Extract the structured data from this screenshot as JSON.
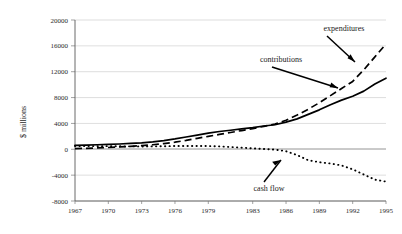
{
  "chart_data": {
    "type": "line",
    "title": "",
    "xlabel": "",
    "ylabel": "$ millions",
    "xlim": [
      1967,
      1995
    ],
    "ylim": [
      -8000,
      20000
    ],
    "grid": true,
    "legend_position": "inline-annotations",
    "x_tick_labels": [
      "1967",
      "1970",
      "1973",
      "1976",
      "1979",
      "1983",
      "1986",
      "1989",
      "1992",
      "1995"
    ],
    "x_tick_values": [
      1967,
      1970,
      1973,
      1976,
      1979,
      1983,
      1986,
      1989,
      1992,
      1995
    ],
    "y_tick_labels": [
      "20000",
      "16000",
      "12000",
      "8000",
      "4000",
      "0",
      "-4000",
      "-8000"
    ],
    "y_tick_values": [
      20000,
      16000,
      12000,
      8000,
      4000,
      0,
      -4000,
      -8000
    ],
    "x": [
      1967,
      1968,
      1969,
      1970,
      1971,
      1972,
      1973,
      1974,
      1975,
      1976,
      1977,
      1978,
      1979,
      1980,
      1981,
      1982,
      1983,
      1984,
      1985,
      1986,
      1987,
      1988,
      1989,
      1990,
      1991,
      1992,
      1993,
      1994,
      1995
    ],
    "series": [
      {
        "name": "contributions",
        "style": "solid",
        "color": "#000000",
        "values": [
          600,
          650,
          700,
          760,
          820,
          900,
          1000,
          1150,
          1350,
          1600,
          1900,
          2200,
          2500,
          2750,
          2950,
          3150,
          3350,
          3600,
          3800,
          4200,
          4700,
          5400,
          6100,
          6900,
          7600,
          8200,
          9000,
          10100,
          11000
        ]
      },
      {
        "name": "expenditures",
        "style": "dashed",
        "color": "#000000",
        "values": [
          100,
          150,
          210,
          280,
          360,
          450,
          560,
          700,
          880,
          1100,
          1380,
          1700,
          2000,
          2300,
          2600,
          2900,
          3200,
          3550,
          3900,
          4500,
          5300,
          6200,
          7200,
          8300,
          9400,
          10500,
          12300,
          14300,
          16300
        ]
      },
      {
        "name": "cash flow",
        "style": "dotted",
        "color": "#000000",
        "values": [
          500,
          500,
          490,
          480,
          460,
          450,
          440,
          450,
          470,
          500,
          520,
          500,
          500,
          450,
          350,
          250,
          150,
          50,
          -50,
          -300,
          -900,
          -1700,
          -2000,
          -2200,
          -2500,
          -3100,
          -3900,
          -4700,
          -5000
        ]
      }
    ],
    "annotations": [
      {
        "text": "expenditures",
        "target_series": "expenditures"
      },
      {
        "text": "contributions",
        "target_series": "contributions"
      },
      {
        "text": "cash flow",
        "target_series": "cash flow"
      }
    ]
  }
}
